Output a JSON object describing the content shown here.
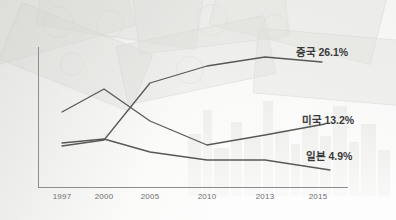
{
  "chart_data": {
    "type": "line",
    "title": "",
    "xlabel": "",
    "ylabel": "",
    "categories": [
      "1997",
      "2000",
      "2005",
      "2010",
      "2013",
      "2015"
    ],
    "grid": false,
    "legend_position": "right-inline-end-of-line",
    "series": [
      {
        "name": "중국",
        "end_label": "중국 26.1%",
        "end_value": "26.1%",
        "color": "#585858",
        "points": [
          {
            "x": 62,
            "y": 146
          },
          {
            "x": 104,
            "y": 140
          },
          {
            "x": 150,
            "y": 83
          },
          {
            "x": 207,
            "y": 66
          },
          {
            "x": 265,
            "y": 57
          },
          {
            "x": 322,
            "y": 62
          }
        ]
      },
      {
        "name": "미국",
        "end_label": "미국 13.2%",
        "end_value": "13.2%",
        "color": "#585858",
        "points": [
          {
            "x": 62,
            "y": 112
          },
          {
            "x": 104,
            "y": 89
          },
          {
            "x": 150,
            "y": 121
          },
          {
            "x": 207,
            "y": 145
          },
          {
            "x": 265,
            "y": 135
          },
          {
            "x": 325,
            "y": 124
          }
        ]
      },
      {
        "name": "일본",
        "end_label": "일본 4.9%",
        "end_value": "4.9%",
        "color": "#585858",
        "points": [
          {
            "x": 62,
            "y": 143
          },
          {
            "x": 104,
            "y": 139
          },
          {
            "x": 150,
            "y": 152
          },
          {
            "x": 207,
            "y": 160
          },
          {
            "x": 265,
            "y": 160
          },
          {
            "x": 330,
            "y": 170
          }
        ]
      }
    ],
    "annotations": [
      {
        "name": "china-end-label",
        "text": "중국 26.1%",
        "x": 296,
        "y": 44
      },
      {
        "name": "usa-end-label",
        "text": "미국 13.2%",
        "x": 302,
        "y": 112
      },
      {
        "name": "japan-end-label",
        "text": "일본 4.9%",
        "x": 306,
        "y": 148
      }
    ],
    "axis": {
      "x_ticks": [
        {
          "label": "1997",
          "x": 62
        },
        {
          "label": "2000",
          "x": 104
        },
        {
          "label": "2005",
          "x": 150
        },
        {
          "label": "2010",
          "x": 207
        },
        {
          "label": "2013",
          "x": 265
        },
        {
          "label": "2015",
          "x": 318
        }
      ],
      "axis_color": "#8d8d8d"
    },
    "background": {
      "description": "faded banknote collage upper-left, faded city skyline lower-right",
      "wash_color": "#f4f4f1"
    }
  }
}
